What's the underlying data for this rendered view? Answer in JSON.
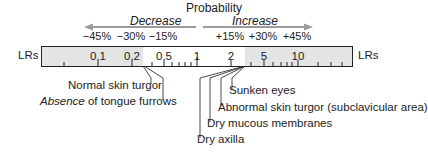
{
  "title": "Probability",
  "direction": {
    "decrease_label": "Decrease",
    "increase_label": "Increase",
    "arrow_color": "#9a9a9a"
  },
  "percentages": [
    {
      "label": "−45%",
      "x": 97
    },
    {
      "label": "−30%",
      "x": 131
    },
    {
      "label": "−15%",
      "x": 163
    },
    {
      "label": "+15%",
      "x": 230
    },
    {
      "label": "+30%",
      "x": 263
    },
    {
      "label": "+45%",
      "x": 297
    }
  ],
  "scale": {
    "axis_label_left": "LRs",
    "axis_label_right": "LRs",
    "shade_color": "#e4e4e4",
    "ticks": [
      {
        "label": "0.1",
        "x": 56
      },
      {
        "label": "0.2",
        "x": 90
      },
      {
        "label": "0.5",
        "x": 122
      },
      {
        "label": "1",
        "x": 155
      },
      {
        "label": "2",
        "x": 189
      },
      {
        "label": "5",
        "x": 222
      },
      {
        "label": "10",
        "x": 256
      }
    ]
  },
  "findings_decrease": [
    {
      "label": "Normal skin turgor"
    },
    {
      "label_italic": "Absence",
      "label_rest": " of tongue furrows"
    }
  ],
  "findings_increase": [
    {
      "label": "Sunken eyes"
    },
    {
      "label": "Abnormal skin turgor (subclavicular area)"
    },
    {
      "label": "Dry mucous membranes"
    },
    {
      "label": "Dry axilla"
    }
  ]
}
